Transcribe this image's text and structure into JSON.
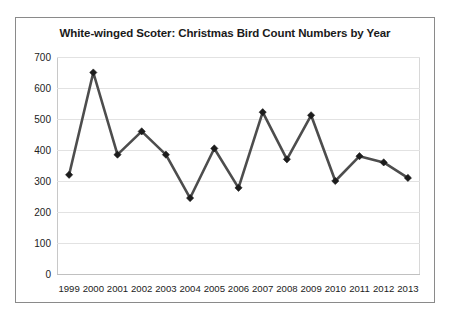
{
  "chart_data": {
    "type": "line",
    "title": "White-winged Scoter: Christmas Bird Count Numbers by Year",
    "xlabel": "",
    "ylabel": "",
    "categories": [
      "1999",
      "2000",
      "2001",
      "2002",
      "2003",
      "2004",
      "2005",
      "2006",
      "2007",
      "2008",
      "2009",
      "2010",
      "2011",
      "2012",
      "2013"
    ],
    "values": [
      320,
      650,
      385,
      460,
      385,
      245,
      405,
      278,
      522,
      370,
      512,
      300,
      380,
      360,
      310
    ],
    "series": [
      {
        "name": "White-winged Scoter",
        "values": [
          320,
          650,
          385,
          460,
          385,
          245,
          405,
          278,
          522,
          370,
          512,
          300,
          380,
          360,
          310
        ]
      }
    ],
    "ylim": [
      0,
      700
    ],
    "yticks": [
      0,
      100,
      200,
      300,
      400,
      500,
      600,
      700
    ],
    "ytick_labels": [
      "0",
      "100",
      "200",
      "300",
      "400",
      "500",
      "600",
      "700"
    ],
    "grid": true,
    "legend": false,
    "legend_position": "none",
    "marker": "diamond",
    "line_color": "#4d4d4d",
    "marker_color": "#1c1c1c",
    "grid_color": "#e2e2e2",
    "background_color": "#ffffff",
    "border_color": "#8a8a8a"
  }
}
